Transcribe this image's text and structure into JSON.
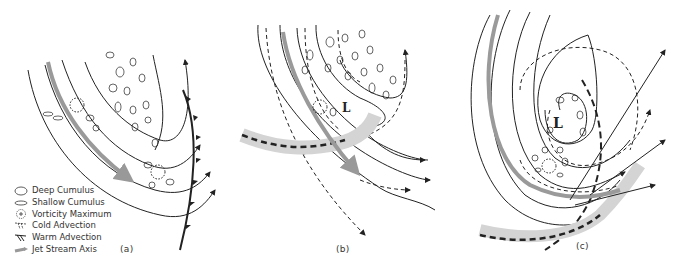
{
  "figure": {
    "panels": [
      {
        "id": "a",
        "label": "(a)"
      },
      {
        "id": "b",
        "label": "(b)"
      },
      {
        "id": "c",
        "label": "(c)"
      }
    ],
    "low_label": "L",
    "cold_marker": "C",
    "warm_marker": "W"
  },
  "legend": {
    "items": [
      {
        "symbol": "deep-cumulus",
        "label": "Deep Cumulus"
      },
      {
        "symbol": "shallow-cumulus",
        "label": "Shallow Cumulus"
      },
      {
        "symbol": "vorticity-maximum",
        "label": "Vorticity Maximum"
      },
      {
        "symbol": "cold-advection",
        "label": "Cold Advection"
      },
      {
        "symbol": "warm-advection",
        "label": "Warm Advection"
      },
      {
        "symbol": "jet-stream-axis",
        "label": "Jet Stream Axis"
      }
    ]
  },
  "colors": {
    "line": "#222222",
    "jet": "#9a9a9a",
    "band": "#d4d4d4"
  }
}
